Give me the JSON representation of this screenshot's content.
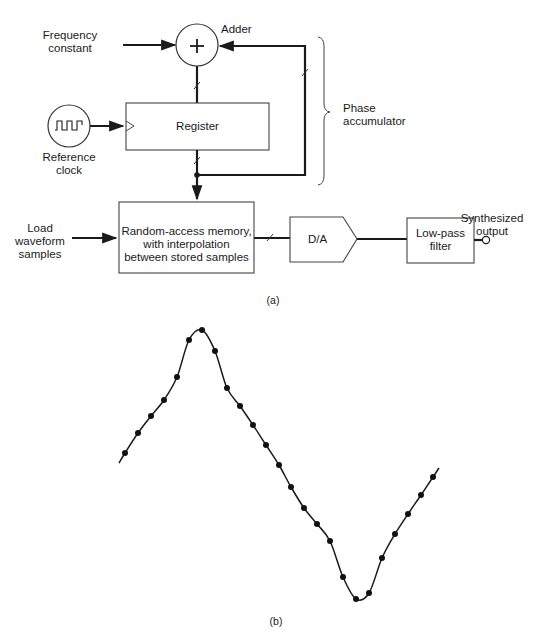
{
  "figure_a": {
    "caption": "(a)",
    "inputs": {
      "frequency_constant": [
        "Frequency",
        "constant"
      ],
      "reference_clock": [
        "Reference",
        "clock"
      ],
      "load_waveform": [
        "Load",
        "waveform",
        "samples"
      ]
    },
    "blocks": {
      "adder": {
        "label": "Adder",
        "symbol": "+"
      },
      "register": {
        "label": "Register"
      },
      "ram": {
        "lines": [
          "Random-access memory,",
          "with interpolation",
          "between stored samples"
        ]
      },
      "dac": {
        "label": "D/A"
      },
      "lowpass": {
        "lines": [
          "Low-pass",
          "filter"
        ]
      }
    },
    "group": {
      "label": [
        "Phase",
        "accumulator"
      ]
    },
    "output": {
      "label": [
        "Synthesized",
        "output"
      ]
    }
  },
  "figure_b": {
    "caption": "(b)",
    "waveform_samples": [
      [
        125,
        453
      ],
      [
        138,
        433
      ],
      [
        151,
        416
      ],
      [
        164,
        400
      ],
      [
        177,
        377
      ],
      [
        189,
        340
      ],
      [
        202,
        330
      ],
      [
        215,
        351
      ],
      [
        227,
        388
      ],
      [
        240,
        406
      ],
      [
        253,
        425
      ],
      [
        266,
        445
      ],
      [
        279,
        465
      ],
      [
        291,
        487
      ],
      [
        304,
        508
      ],
      [
        317,
        524
      ],
      [
        330,
        541
      ],
      [
        343,
        577
      ],
      [
        356,
        599
      ],
      [
        369,
        593
      ],
      [
        382,
        558
      ],
      [
        395,
        534
      ],
      [
        408,
        514
      ],
      [
        421,
        495
      ],
      [
        433,
        477
      ]
    ],
    "line_start": [
      119,
      463
    ],
    "line_end": [
      439,
      468
    ]
  }
}
